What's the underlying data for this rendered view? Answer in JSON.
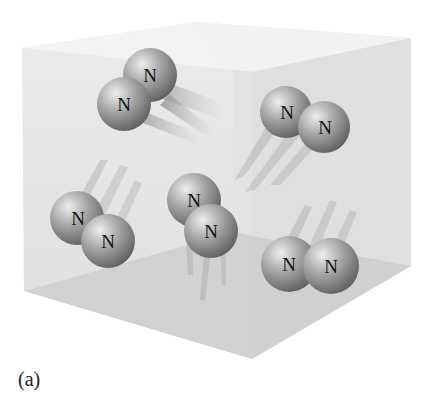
{
  "figure": {
    "caption": "(a)"
  },
  "molecules": [
    {
      "id": "top-left",
      "atoms": [
        {
          "label": "N",
          "cx": 150,
          "cy": 75
        },
        {
          "label": "N",
          "cx": 124,
          "cy": 104
        }
      ],
      "trail_angle": 30
    },
    {
      "id": "top-right",
      "atoms": [
        {
          "label": "N",
          "cx": 286,
          "cy": 112
        },
        {
          "label": "N",
          "cx": 324,
          "cy": 127
        }
      ],
      "trail_angle": 125
    },
    {
      "id": "left",
      "atoms": [
        {
          "label": "N",
          "cx": 77,
          "cy": 218
        },
        {
          "label": "N",
          "cx": 108,
          "cy": 241
        }
      ],
      "trail_angle": -50
    },
    {
      "id": "center",
      "atoms": [
        {
          "label": "N",
          "cx": 194,
          "cy": 200
        },
        {
          "label": "N",
          "cx": 211,
          "cy": 231
        }
      ],
      "trail_angle": 100
    },
    {
      "id": "bottom-right",
      "atoms": [
        {
          "label": "N",
          "cx": 289,
          "cy": 264
        },
        {
          "label": "N",
          "cx": 331,
          "cy": 266
        }
      ],
      "trail_angle": -65
    }
  ],
  "colors": {
    "box_back": "#e9e9e9",
    "box_right": "#d9d9d9",
    "box_floor": "#cfcfcf",
    "box_top": "#f1f1f1",
    "atom_light": "#d8d8d8",
    "atom_dark": "#6e6e6e"
  }
}
